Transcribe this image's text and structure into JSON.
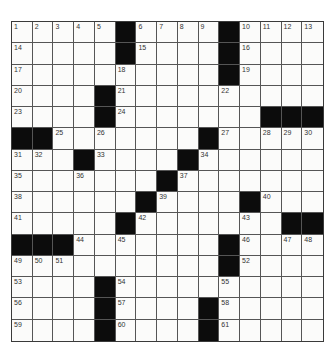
{
  "puzzle": {
    "size": {
      "rows": 15,
      "cols": 15
    },
    "colors": {
      "black": "#0c0c0c",
      "white": "#fbfbfa",
      "line": "#555555"
    },
    "grid": [
      "....#....#....",
      "....#....#....",
      ".........#....",
      "....#.....",
      "....#......####",
      "##.......#.....",
      "...#....#......",
      ".......#.......",
      "......#....#...",
      ".....#.....#.##",
      "###.......#....",
      "..........#....",
      "....#..........",
      "....#....#.....",
      "....#....#....."
    ],
    "layout": [
      [
        1,
        2,
        3,
        4,
        5,
        "#",
        6,
        7,
        8,
        9,
        "#",
        10,
        11,
        12,
        13
      ],
      [
        14,
        0,
        0,
        0,
        0,
        "#",
        15,
        0,
        0,
        0,
        "#",
        16,
        0,
        0,
        0
      ],
      [
        17,
        0,
        0,
        0,
        0,
        18,
        0,
        0,
        0,
        0,
        "#",
        19,
        0,
        0,
        0
      ],
      [
        20,
        0,
        0,
        0,
        "#",
        21,
        0,
        0,
        0,
        0,
        22,
        0,
        0,
        0,
        0
      ],
      [
        23,
        0,
        0,
        0,
        "#",
        24,
        0,
        0,
        0,
        0,
        0,
        0,
        "#",
        "#",
        "#"
      ],
      [
        "#",
        "#",
        25,
        0,
        26,
        0,
        0,
        0,
        0,
        "#",
        27,
        0,
        28,
        29,
        30
      ],
      [
        31,
        32,
        0,
        "#",
        33,
        0,
        0,
        0,
        "#",
        34,
        0,
        0,
        0,
        0,
        0
      ],
      [
        35,
        0,
        0,
        36,
        0,
        0,
        0,
        "#",
        37,
        0,
        0,
        0,
        0,
        0,
        0
      ],
      [
        38,
        0,
        0,
        0,
        0,
        0,
        "#",
        39,
        0,
        0,
        0,
        "#",
        40,
        0,
        0
      ],
      [
        41,
        0,
        0,
        0,
        0,
        "#",
        42,
        0,
        0,
        0,
        0,
        43,
        0,
        "#",
        "#"
      ],
      [
        "#",
        "#",
        "#",
        44,
        0,
        45,
        0,
        0,
        0,
        0,
        "#",
        46,
        0,
        47,
        48
      ],
      [
        49,
        50,
        51,
        0,
        0,
        0,
        0,
        0,
        0,
        0,
        "#",
        52,
        0,
        0,
        0
      ],
      [
        53,
        0,
        0,
        0,
        "#",
        54,
        0,
        0,
        0,
        0,
        55,
        0,
        0,
        0,
        0
      ],
      [
        56,
        0,
        0,
        0,
        "#",
        57,
        0,
        0,
        0,
        "#",
        58,
        0,
        0,
        0,
        0
      ],
      [
        59,
        0,
        0,
        0,
        "#",
        60,
        0,
        0,
        0,
        "#",
        61,
        0,
        0,
        0,
        0
      ]
    ]
  }
}
